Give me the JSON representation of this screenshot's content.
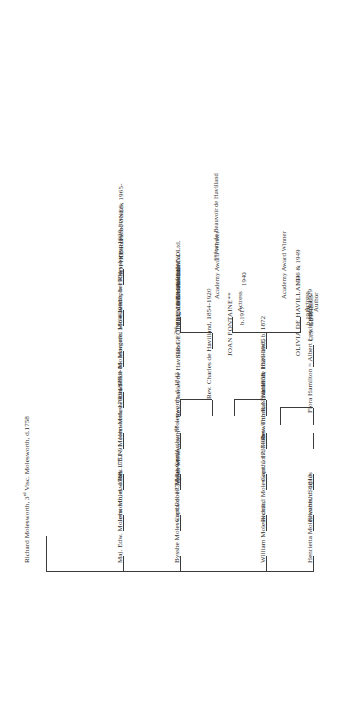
{
  "chart": {
    "generations": [
      {
        "id": "gen1",
        "people": [
          {
            "id": "richard-3rd-visc",
            "label": "Richard Molesworth, 3",
            "sup": "rd",
            "label_tail": " Visc. Molesworth, d.1758"
          }
        ]
      },
      {
        "id": "gen2",
        "people": [
          {
            "id": "maj-edw",
            "label": "Maj. Edw. Molesworth, d. 1768"
          },
          {
            "id": "bysshe",
            "label": "Bysshe Molesworth, d. 1779"
          },
          {
            "id": "william",
            "label": "William Molesworth,"
          },
          {
            "id": "henrietta",
            "label": "Henrietta Molesworth, d. 1813"
          }
        ]
      },
      {
        "id": "gen3",
        "people": [
          {
            "id": "john-1751",
            "label": "John Molesworth, 1751-91"
          },
          {
            "id": "capt-robert",
            "label": "Capt.Robert Molesworth"
          },
          {
            "id": "richard-1737",
            "label": "Richard Molesworth, 1737-99"
          },
          {
            "id": "elizabeth-staples",
            "label": "Elizabeth Staples"
          }
        ]
      },
      {
        "id": "gen4",
        "people": [
          {
            "id": "rev-jen",
            "label": "Rev. J.E.N. Molesworth, 1790-1877"
          },
          {
            "id": "maj-gen-arthur",
            "label": "Maj-Gen.Arthur Molesworth, d. 1843"
          },
          {
            "id": "capt-john-rn",
            "label": "Capt. John Molesworth R.N., d. 1858"
          }
        ]
      },
      {
        "id": "gen5",
        "people": [
          {
            "id": "john-1818",
            "label": "John Molesworth, 1818-86"
          },
          {
            "id": "agnes-marriage",
            "label": "Agnes Molesworth",
            "sup": "1st",
            "label_tail": " = Rev. Charles de Havilland = ",
            "sup2": "2nd",
            "label_tail2": "Margaret Molesworth"
          },
          {
            "id": "rev-thomas-hamilton",
            "label": "Rev. Thomas Hamilton, 1826-1905"
          }
        ]
      },
      {
        "id": "gen6",
        "people": [
          {
            "id": "lawrence",
            "label": "Lawrence Molesworth, 1864-1941"
          },
          {
            "id": "rev-charles-dh",
            "label": "Rev. Charles de Havilland, 1854-1920"
          },
          {
            "id": "walter-dh",
            "label": "Walter de Havilland, b. 1872"
          },
          {
            "id": "flora-hamilton",
            "label": "Flora Hamilton = Albert Lewis, 1863-1929"
          }
        ]
      },
      {
        "id": "gen7",
        "people": [
          {
            "id": "margaret-1904",
            "label": "Margaret Molesworth, b 1904-"
          },
          {
            "id": "sir-geoffrey-dh",
            "label": "SIR GEOFFREY DE HAVILLAND",
            "caps": true
          },
          {
            "id": "olivia-dh",
            "label": "OLIVIA DE HAVILLAND",
            "caps": true
          },
          {
            "id": "joan-fontaine",
            "label": "JOAN FONTAINE**",
            "caps": true
          },
          {
            "id": "cs-lewis",
            "label": "C.S. LEWIS",
            "caps": true
          }
        ]
      },
      {
        "id": "gen8",
        "people": [
          {
            "id": "christopher-rhys-jones",
            "label": "Christopher Rhys-Jones, 1930-"
          }
        ]
      },
      {
        "id": "gen9",
        "people": [
          {
            "id": "sophie-rhys-jones",
            "label": "SOPHIE RHYS-JONES, 1965-",
            "caps": true
          }
        ]
      }
    ],
    "details": {
      "sir_geoffrey": [
        "1882-1965",
        "Director of the",
        "De Havilland",
        "Aircraft Co. Ltd."
      ],
      "olivia": [
        "b.1916",
        "Actress",
        "Academy Award Winner",
        "1946 & 1949"
      ],
      "joan": [
        "b.1917",
        "Actress",
        "Academy Award Winner",
        "1940"
      ],
      "cs_lewis": [
        "1898-1963",
        "Author"
      ],
      "sophie": [
        "Countess of Wessex"
      ]
    },
    "footnote": "**Joan de Beauvoir de Havilland",
    "line_color": "#3d3b39"
  }
}
